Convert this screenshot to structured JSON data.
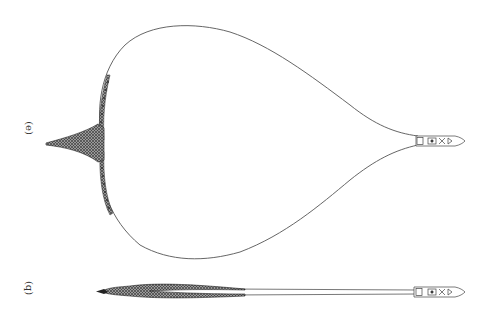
{
  "figure": {
    "panels": [
      {
        "id": "top",
        "label": "(e)",
        "description": "Boat with net deployed in wide pear-shaped loop, funnel-shaped bag at far end"
      },
      {
        "id": "bottom",
        "label": "(q)",
        "description": "Boat towing net in narrow elongated form, bag trailing behind"
      }
    ],
    "colors": {
      "line": "#555555",
      "net_fill": "#444444",
      "background": "#ffffff"
    }
  }
}
